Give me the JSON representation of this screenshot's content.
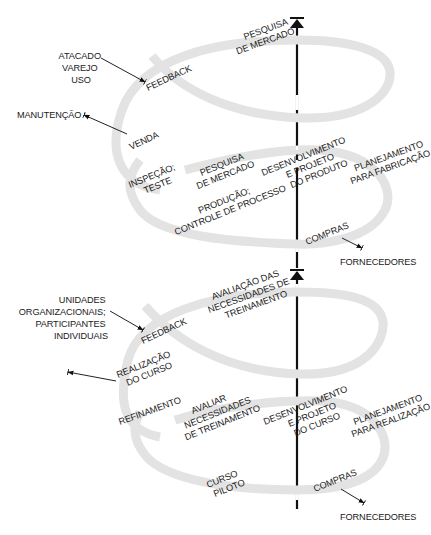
{
  "colors": {
    "spiral": "#e3e3e3",
    "axis": "#111111",
    "text": "#1a1a1a",
    "background": "#ffffff"
  },
  "top_spiral": {
    "name": "product-development-spiral",
    "stages": {
      "market_research_1": [
        "PESQUISA",
        "DE MERCADO"
      ],
      "feedback": "FEEDBACK",
      "sales": "VENDA",
      "inspection": [
        "INSPEÇÃO;",
        "TESTE"
      ],
      "market_research_2": [
        "PESQUISA",
        "DE MERCADO"
      ],
      "development": [
        "DESENVOLVIMENTO",
        "E PROJETO",
        "DO PRODUTO"
      ],
      "planning": [
        "PLANEJAMENTO",
        "PARA FABRICAÇÃO"
      ],
      "production": [
        "PRODUÇÃO;",
        "CONTROLE DE PROCESSO"
      ],
      "purchasing": "COMPRAS"
    },
    "external": {
      "customers": [
        "ATACADO",
        "VAREJO",
        "USO"
      ],
      "maintenance": "MANUTENÇÃO",
      "suppliers": "FORNECEDORES"
    }
  },
  "bottom_spiral": {
    "name": "training-development-spiral",
    "stages": {
      "needs_assessment": [
        "AVALIAÇÃO DAS",
        "NECESSIDADES DE",
        "TREINAMENTO"
      ],
      "feedback": "FEEDBACK",
      "course_delivery": [
        "REALIZAÇÃO",
        "DO CURSO"
      ],
      "refinement": "REFINAMENTO",
      "assess_needs": [
        "AVALIAR",
        "NECESSIDADES",
        "DE TREINAMENTO"
      ],
      "development": [
        "DESENVOLVIMENTO",
        "E PROJETO",
        "DO CURSO"
      ],
      "planning": [
        "PLANEJAMENTO",
        "PARA REALIZAÇÃO"
      ],
      "pilot": [
        "CURSO",
        "PILOTO"
      ],
      "purchasing": "COMPRAS"
    },
    "external": {
      "units": [
        "UNIDADES",
        "ORGANIZACIONAIS;",
        "PARTICIPANTES",
        "INDIVIDUAIS"
      ],
      "suppliers": "FORNECEDORES"
    }
  }
}
